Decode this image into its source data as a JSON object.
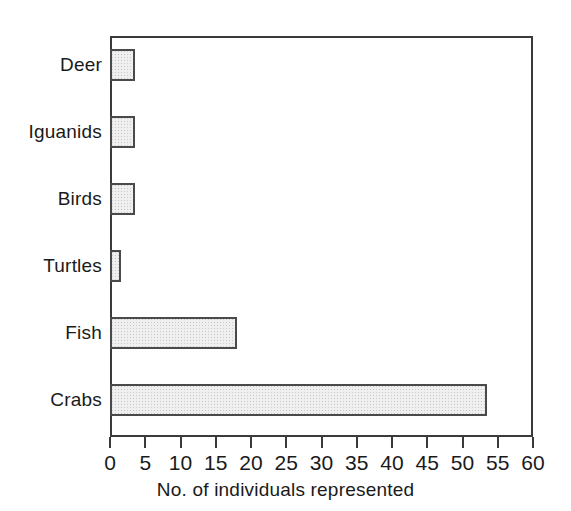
{
  "chart_data": {
    "type": "bar",
    "orientation": "horizontal",
    "title": "",
    "xlabel": "No. of individuals represented",
    "ylabel": "",
    "categories": [
      "Deer",
      "Iguanids",
      "Birds",
      "Turtles",
      "Fish",
      "Crabs"
    ],
    "values": [
      3.5,
      3.5,
      3.5,
      1.5,
      18,
      53.5
    ],
    "xlim": [
      0,
      60
    ],
    "xticks": [
      0,
      5,
      10,
      15,
      20,
      25,
      30,
      35,
      40,
      45,
      50,
      55,
      60
    ],
    "xtick_labels": [
      "0",
      "5",
      "10",
      "15",
      "20",
      "25",
      "30",
      "35",
      "40",
      "45",
      "50",
      "55",
      "60"
    ],
    "grid": false,
    "legend": null,
    "series": [
      {
        "name": "No. of individuals represented",
        "values": [
          3.5,
          3.5,
          3.5,
          1.5,
          18,
          53.5
        ]
      }
    ],
    "colors": {
      "bar_fill": "#efefef",
      "bar_stipple": "#c9c9c9",
      "bar_edge": "#4a4a4a",
      "axis": "#3a3a3a",
      "text": "#1a1a1a",
      "background": "#ffffff"
    }
  }
}
